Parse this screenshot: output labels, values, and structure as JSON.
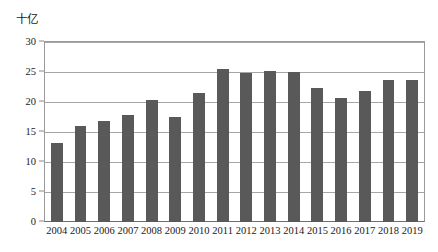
{
  "chart_data": {
    "type": "bar",
    "title": "",
    "ylabel": "十亿",
    "xlabel": "",
    "categories": [
      "2004",
      "2005",
      "2006",
      "2007",
      "2008",
      "2009",
      "2010",
      "2011",
      "2012",
      "2013",
      "2014",
      "2015",
      "2016",
      "2017",
      "2018",
      "2019"
    ],
    "values": [
      13.1,
      16.0,
      16.8,
      17.8,
      20.3,
      17.5,
      21.5,
      25.5,
      24.8,
      25.1,
      25.0,
      22.3,
      20.7,
      21.8,
      23.6,
      23.7
    ],
    "ylim": [
      0,
      30
    ],
    "yticks": [
      0,
      5,
      10,
      15,
      20,
      25,
      30
    ],
    "ytick_labels": [
      "0",
      "5",
      "10",
      "15",
      "20",
      "25",
      "30"
    ],
    "grid": true,
    "legend": false,
    "series_color": "#595959",
    "gridline_color": "#a6a6a6",
    "axis_color": "#9a9a9a"
  }
}
